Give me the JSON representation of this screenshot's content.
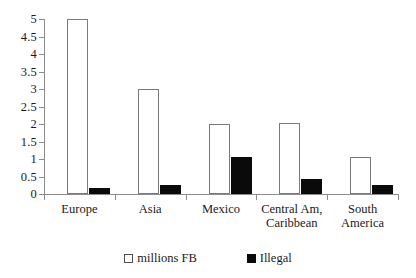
{
  "chart_data": {
    "type": "bar",
    "title": "",
    "subtitle": "",
    "xlabel": "",
    "ylabel": "",
    "ylim": [
      0,
      5
    ],
    "grid": false,
    "legend_position": "bottom-center",
    "categories": [
      "Europe",
      "Asia",
      "Mexico",
      "Central Am,\nCaribbean",
      "South\nAmerica"
    ],
    "ytick_labels": [
      "0",
      "0.5",
      "1",
      "1.5",
      "2",
      "2.5",
      "3",
      "3.5",
      "4",
      "4.5",
      "5"
    ],
    "ytick_values": [
      0,
      0.5,
      1,
      1.5,
      2,
      2.5,
      3,
      3.5,
      4,
      4.5,
      5
    ],
    "series": [
      {
        "name": "millions FB",
        "color": "#ffffff",
        "edge_color": "#7a7a7a",
        "values": [
          5.0,
          3.0,
          2.0,
          2.02,
          1.05
        ]
      },
      {
        "name": "Illegal",
        "color": "#0a0a0a",
        "edge_color": "#0a0a0a",
        "values": [
          0.17,
          0.25,
          1.05,
          0.42,
          0.27
        ]
      }
    ]
  },
  "legend": {
    "items": [
      {
        "label": "millions FB",
        "swatch": "white-square-outline"
      },
      {
        "label": "Illegal",
        "swatch": "black-filled-square"
      }
    ]
  }
}
